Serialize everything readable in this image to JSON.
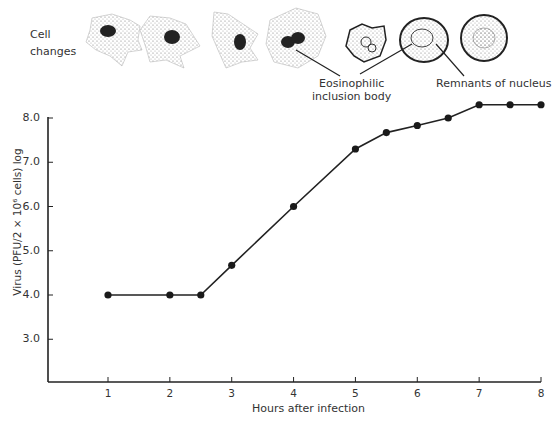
{
  "illustration": {
    "cell_changes_label_line1": "Cell",
    "cell_changes_label_line2": "changes",
    "annotation_inclusion_line1": "Eosinophilic",
    "annotation_inclusion_line2": "inclusion body",
    "annotation_remnants": "Remnants of nucleus"
  },
  "axes": {
    "ylabel": "Virus (PFU/2 × 10⁶ cells) log",
    "xlabel": "Hours after infection",
    "yticks": [
      "8.0",
      "7.0",
      "6.0",
      "5.0",
      "4.0",
      "3.0"
    ],
    "xticks": [
      "1",
      "2",
      "3",
      "4",
      "5",
      "6",
      "7",
      "8"
    ]
  },
  "chart_data": {
    "type": "line",
    "title": "",
    "xlabel": "Hours after infection",
    "ylabel": "Virus (PFU/2 × 10⁶ cells) log",
    "xlim": [
      0,
      8
    ],
    "ylim": [
      2,
      8
    ],
    "grid": false,
    "legend": null,
    "x_ticks": [
      1,
      2,
      3,
      4,
      5,
      6,
      7,
      8
    ],
    "y_ticks": [
      3.0,
      4.0,
      5.0,
      6.0,
      7.0,
      8.0
    ],
    "series": [
      {
        "name": "Virus titer",
        "x": [
          1,
          2,
          2.5,
          3,
          4,
          5,
          5.5,
          6,
          6.5,
          7,
          7.5,
          8
        ],
        "values": [
          4.0,
          4.0,
          4.0,
          4.67,
          6.0,
          7.3,
          7.67,
          7.83,
          8.0,
          8.3,
          8.3,
          8.3
        ]
      }
    ],
    "annotations": [
      "Cell changes",
      "Eosinophilic inclusion body",
      "Remnants of nucleus"
    ]
  }
}
